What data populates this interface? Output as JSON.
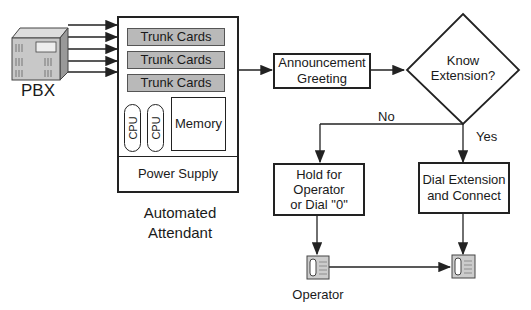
{
  "diagram": {
    "pbx": {
      "label": "PBX",
      "icon": "pbx-cabinet-icon"
    },
    "automated_attendant": {
      "label": "Automated\nAttendant",
      "trunk_cards": [
        "Trunk Cards",
        "Trunk Cards",
        "Trunk Cards"
      ],
      "cpus": [
        "CPU",
        "CPU"
      ],
      "memory": "Memory",
      "power_supply": "Power Supply"
    },
    "announcement": "Announcement\nGreeting",
    "decision": "Know\nExtension?",
    "branch_no": "No",
    "branch_yes": "Yes",
    "hold_box": "Hold for\nOperator\nor Dial \"0\"",
    "dial_box": "Dial Extension\nand Connect",
    "operator_label": "Operator",
    "phone_icon": "telephone-icon",
    "colors": {
      "line": "#222222",
      "card_fill": "#b9b9b9",
      "pbx_fill": "#c8c8c8"
    }
  }
}
